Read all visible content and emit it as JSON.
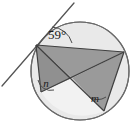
{
  "figure": {
    "type": "geometry-diagram",
    "width": 136,
    "height": 131,
    "background_color": "#ffffff"
  },
  "colors": {
    "stroke": "#4d4d4d",
    "stroke_dark": "#3a3a3a",
    "circle_fill": "#e8e8e8",
    "shaded_polygon": "#9a9a9a",
    "shaded_polygon_alt": "#8f8f8f",
    "light_sector": "#efefef",
    "label_color": "#1a1a1a",
    "tangent_color": "#555555"
  },
  "circle": {
    "label": "circle",
    "cx": 80,
    "cy": 71,
    "r": 49,
    "fill": "#e9e9e9",
    "stroke": "#6a6a6a",
    "stroke_width": 1.2
  },
  "points": {
    "A": {
      "name": "tangent-point-A",
      "x": 36,
      "y": 45
    },
    "B": {
      "name": "vertex-B",
      "x": 124,
      "y": 52
    },
    "C": {
      "name": "vertex-C",
      "x": 41,
      "y": 92
    },
    "D": {
      "name": "vertex-D",
      "x": 104,
      "y": 111
    },
    "X": {
      "name": "intersection-X",
      "x": 72,
      "y": 78
    }
  },
  "tangent_line": {
    "name": "tangent-line",
    "x1": 2,
    "y1": 86,
    "x2": 74,
    "y2": 3,
    "stroke": "#555555",
    "stroke_width": 1.3
  },
  "chords": [
    {
      "name": "chord-AB",
      "x1": 36,
      "y1": 45,
      "x2": 124,
      "y2": 52
    },
    {
      "name": "chord-AC",
      "x1": 36,
      "y1": 45,
      "x2": 41,
      "y2": 92
    },
    {
      "name": "chord-AD",
      "x1": 36,
      "y1": 45,
      "x2": 104,
      "y2": 111
    },
    {
      "name": "chord-BC",
      "x1": 124,
      "y1": 52,
      "x2": 41,
      "y2": 92
    },
    {
      "name": "chord-BD",
      "x1": 124,
      "y1": 52,
      "x2": 104,
      "y2": 111
    }
  ],
  "shaded_regions": [
    {
      "name": "shaded-triangle-ABX",
      "points": "36,45 124,52 72,78",
      "fill": "#9a9a9a"
    },
    {
      "name": "shaded-triangle-ACX",
      "points": "36,45 41,92 72,78",
      "fill": "#909090"
    },
    {
      "name": "shaded-triangle-BXD",
      "points": "124,52 72,78 104,111",
      "fill": "#9a9a9a"
    }
  ],
  "labels": {
    "tangent_angle": {
      "name": "angle-label-59-degrees",
      "text": "59°",
      "value": 59,
      "unit": "degrees",
      "x": 57,
      "y": 39
    },
    "angle_n": {
      "name": "angle-label-n",
      "text": "n",
      "x": 46,
      "y": 87
    },
    "angle_m": {
      "name": "angle-label-m",
      "text": "m",
      "x": 95,
      "y": 102
    }
  },
  "angle_arcs": [
    {
      "name": "arc-59-degrees",
      "d": "M 52 27 A 22 22 0 0 1 72 43"
    },
    {
      "name": "arc-n",
      "d": "M 38 80 A 13 13 0 0 0 54 90"
    },
    {
      "name": "arc-m",
      "d": "M 89 97 A 15 15 0 0 0 106 97"
    }
  ]
}
